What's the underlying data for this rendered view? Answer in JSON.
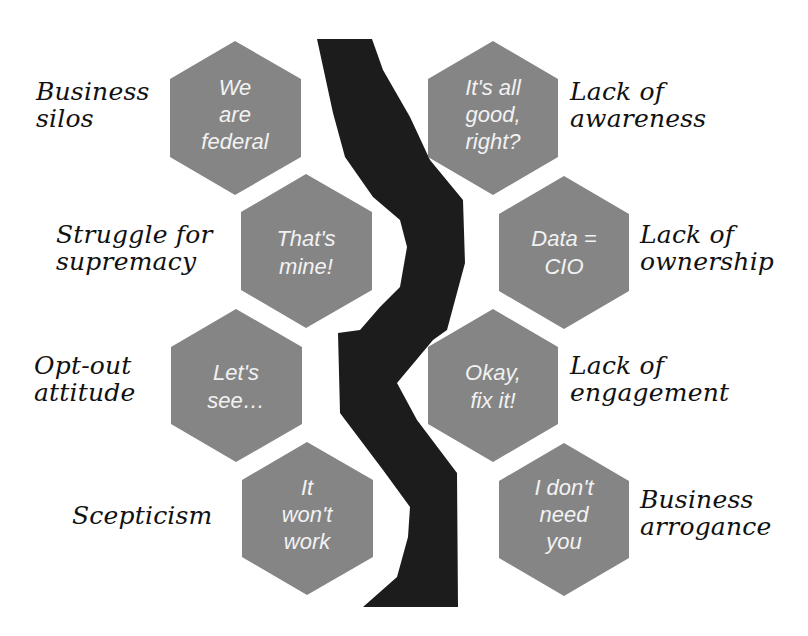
{
  "colors": {
    "background": "#ffffff",
    "hexagon_fill": "#858585",
    "hexagon_text": "#f2f2f2",
    "river": "#1c1c1c",
    "label_text": "#111111"
  },
  "diagram": {
    "type": "hexagon-divide",
    "divider": "black river separating left and right hexagon columns",
    "left_side": [
      {
        "quote": [
          "We",
          "are",
          "federal"
        ],
        "label": [
          "Business",
          "silos"
        ]
      },
      {
        "quote": [
          "That's",
          "mine!"
        ],
        "label": [
          "Struggle for",
          "supremacy"
        ]
      },
      {
        "quote": [
          "Let's",
          "see…"
        ],
        "label": [
          "Opt-out",
          "attitude"
        ]
      },
      {
        "quote": [
          "It",
          "won't",
          "work"
        ],
        "label": [
          "Scepticism"
        ]
      }
    ],
    "right_side": [
      {
        "quote": [
          "It's all",
          "good,",
          "right?"
        ],
        "label": [
          "Lack of",
          "awareness"
        ]
      },
      {
        "quote": [
          "Data =",
          "CIO"
        ],
        "label": [
          "Lack of",
          "ownership"
        ]
      },
      {
        "quote": [
          "Okay,",
          "fix it!"
        ],
        "label": [
          "Lack of",
          "engagement"
        ]
      },
      {
        "quote": [
          "I don't",
          "need",
          "you"
        ],
        "label": [
          "Business",
          "arrogance"
        ]
      }
    ]
  }
}
